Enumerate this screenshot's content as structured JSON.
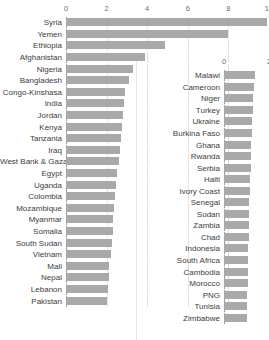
{
  "colors": {
    "bar": "#a9a9a9",
    "axis": "#9a9a9a",
    "grid": "#e2e2e2",
    "label_text": "#3d3d3d",
    "tick_text": "#6e6e6e",
    "background": "#ffffff"
  },
  "chart_data": [
    {
      "id": "left-chart",
      "type": "bar",
      "orientation": "horizontal",
      "title": "",
      "subtitle": "",
      "xlabel": "",
      "ylabel": "",
      "xlim": [
        0,
        10
      ],
      "xticks": [
        0,
        2,
        4,
        6,
        8,
        10
      ],
      "xtick_labels": [
        "0",
        "2",
        "4",
        "6",
        "8",
        "10"
      ],
      "grid": true,
      "legend": "none",
      "categories": [
        "Syria",
        "Yemen",
        "Ethiopia",
        "Afghanistan",
        "Nigeria",
        "Bangladesh",
        "Congo-Kinshasa",
        "India",
        "Jordan",
        "Kenya",
        "Tanzania",
        "Iraq",
        "West Bank & Gaza",
        "Egypt",
        "Uganda",
        "Colombia",
        "Mozambique",
        "Myanmar",
        "Somalia",
        "South Sudan",
        "Vietnam",
        "Mali",
        "Nepal",
        "Lebanon",
        "Pakistan"
      ],
      "values": [
        9.9,
        8.0,
        4.9,
        3.9,
        3.3,
        3.1,
        2.9,
        2.85,
        2.8,
        2.75,
        2.7,
        2.65,
        2.6,
        2.5,
        2.45,
        2.4,
        2.35,
        2.3,
        2.3,
        2.25,
        2.2,
        2.1,
        2.1,
        2.05,
        2.0
      ]
    },
    {
      "id": "right-chart",
      "type": "bar",
      "orientation": "horizontal",
      "title": "",
      "subtitle": "",
      "xlabel": "",
      "ylabel": "",
      "xlim": [
        0,
        2
      ],
      "xticks": [
        0,
        2
      ],
      "xtick_labels": [
        "0",
        "2"
      ],
      "grid": true,
      "legend": "none",
      "categories": [
        "Malawi",
        "Cameroon",
        "Niger",
        "Turkey",
        "Ukraine",
        "Burkina Faso",
        "Ghana",
        "Rwanda",
        "Serbia",
        "Haiti",
        "Ivory Coast",
        "Senegal",
        "Sudan",
        "Zambia",
        "Chad",
        "Indonesia",
        "South Africa",
        "Cambodia",
        "Morocco",
        "PNG",
        "Tunisia",
        "Zimbabwe"
      ],
      "values": [
        1.36,
        1.33,
        1.3,
        1.28,
        1.26,
        1.24,
        1.22,
        1.2,
        1.19,
        1.17,
        1.15,
        1.13,
        1.12,
        1.1,
        1.09,
        1.08,
        1.07,
        1.06,
        1.05,
        1.04,
        1.02,
        1.0
      ]
    }
  ]
}
